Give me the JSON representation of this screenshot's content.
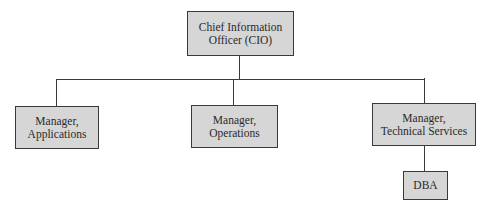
{
  "chart": {
    "root": {
      "line1": "Chief Information",
      "line2": "Officer (CIO)"
    },
    "children": [
      {
        "line1": "Manager,",
        "line2": "Applications"
      },
      {
        "line1": "Manager,",
        "line2": "Operations"
      },
      {
        "line1": "Manager,",
        "line2": "Technical Services"
      }
    ],
    "grandchild": {
      "label": "DBA"
    }
  },
  "colors": {
    "box_fill": "#d6d6d6",
    "border": "#3a3a3a",
    "text": "#2a2a2a"
  }
}
